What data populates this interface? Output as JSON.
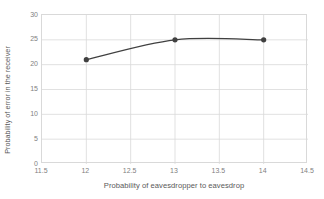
{
  "chart_data": {
    "type": "line",
    "title": "",
    "xlabel": "Probability of eavesdropper to eavesdrop",
    "ylabel": "Probability of error in the receiver",
    "x": [
      12,
      13,
      14
    ],
    "values": [
      21,
      25,
      25
    ],
    "series": [
      {
        "name": "Probability of error in the receiver",
        "x": [
          12,
          13,
          14
        ],
        "values": [
          21,
          25,
          25
        ],
        "line_color": "#404040",
        "marker_color": "#404040",
        "marker": "circle",
        "smooth": true
      }
    ],
    "xlim": [
      11.5,
      14.5
    ],
    "ylim": [
      0,
      30
    ],
    "xticks": [
      11.5,
      12,
      12.5,
      13,
      13.5,
      14,
      14.5
    ],
    "xtick_labels": [
      "11.5",
      "12",
      "12.5",
      "13",
      "13.5",
      "14",
      "14.5"
    ],
    "yticks": [
      0,
      5,
      10,
      15,
      20,
      25,
      30
    ],
    "ytick_labels": [
      "0",
      "5",
      "10",
      "15",
      "20",
      "25",
      "30"
    ],
    "grid": "both",
    "grid_color": "#d9d9d9",
    "plot_border_color": "#d9d9d9",
    "legend": "none",
    "background": "#ffffff"
  },
  "axes": {
    "y_title": "Probability of error in the receiver",
    "x_title": "Probability of eavesdropper to eavesdrop"
  }
}
